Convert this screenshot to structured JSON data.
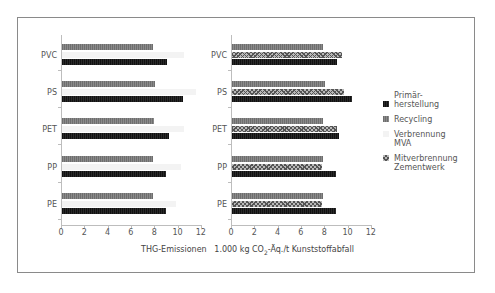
{
  "chart_data": [
    {
      "type": "bar",
      "orientation": "horizontal",
      "title": "",
      "categories": [
        "PVC",
        "PS",
        "PET",
        "PP",
        "PE"
      ],
      "series": [
        {
          "name": "Recycling",
          "values": [
            7.8,
            8.0,
            7.9,
            7.8,
            7.8
          ]
        },
        {
          "name": "Verbrennung MVA",
          "values": [
            10.5,
            11.5,
            10.5,
            10.2,
            9.8
          ]
        },
        {
          "name": "Primärherstellung",
          "values": [
            9.0,
            10.4,
            9.2,
            8.9,
            8.9
          ]
        }
      ],
      "xlabel": "THG-Emissionen 1.000 kg CO2-Äq./t Kunststoffabfall",
      "ylabel": "",
      "xlim": [
        0,
        12
      ],
      "xticks": [
        0,
        2,
        4,
        6,
        8,
        10,
        12
      ],
      "grid": false
    },
    {
      "type": "bar",
      "orientation": "horizontal",
      "title": "",
      "categories": [
        "PVC",
        "PS",
        "PET",
        "PP",
        "PE"
      ],
      "series": [
        {
          "name": "Recycling",
          "values": [
            7.8,
            8.0,
            7.8,
            7.8,
            7.8
          ]
        },
        {
          "name": "Mitverbrennung Zementwerk",
          "values": [
            9.4,
            9.6,
            9.0,
            7.7,
            7.7
          ]
        },
        {
          "name": "Primärherstellung",
          "values": [
            9.0,
            10.3,
            9.2,
            8.9,
            8.9
          ]
        }
      ],
      "xlabel": "THG-Emissionen 1.000 kg CO2-Äq./t Kunststoffabfall",
      "ylabel": "",
      "xlim": [
        0,
        12
      ],
      "xticks": [
        0,
        2,
        4,
        6,
        8,
        10,
        12
      ],
      "grid": false
    }
  ],
  "legend": {
    "items": [
      {
        "line1": "Primär-",
        "line2": "herstellung",
        "swatch": "pri"
      },
      {
        "line1": "Recycling",
        "line2": "",
        "swatch": "rec"
      },
      {
        "line1": "Verbrennung",
        "line2": "MVA",
        "swatch": "mva"
      },
      {
        "line1": "Mitverbrennung",
        "line2": "Zementwerk",
        "swatch": "mit"
      }
    ]
  },
  "xtitle": {
    "prefix": "THG-Emissionen   1.000 kg CO",
    "sub": "2",
    "suffix": "-Äq./t Kunststoffabfall"
  },
  "colors": {
    "primary": "#111111",
    "recycling": "#7a7a7a",
    "mva": "#f3f3f3",
    "mitverbrennung": "#b9b9b9"
  }
}
